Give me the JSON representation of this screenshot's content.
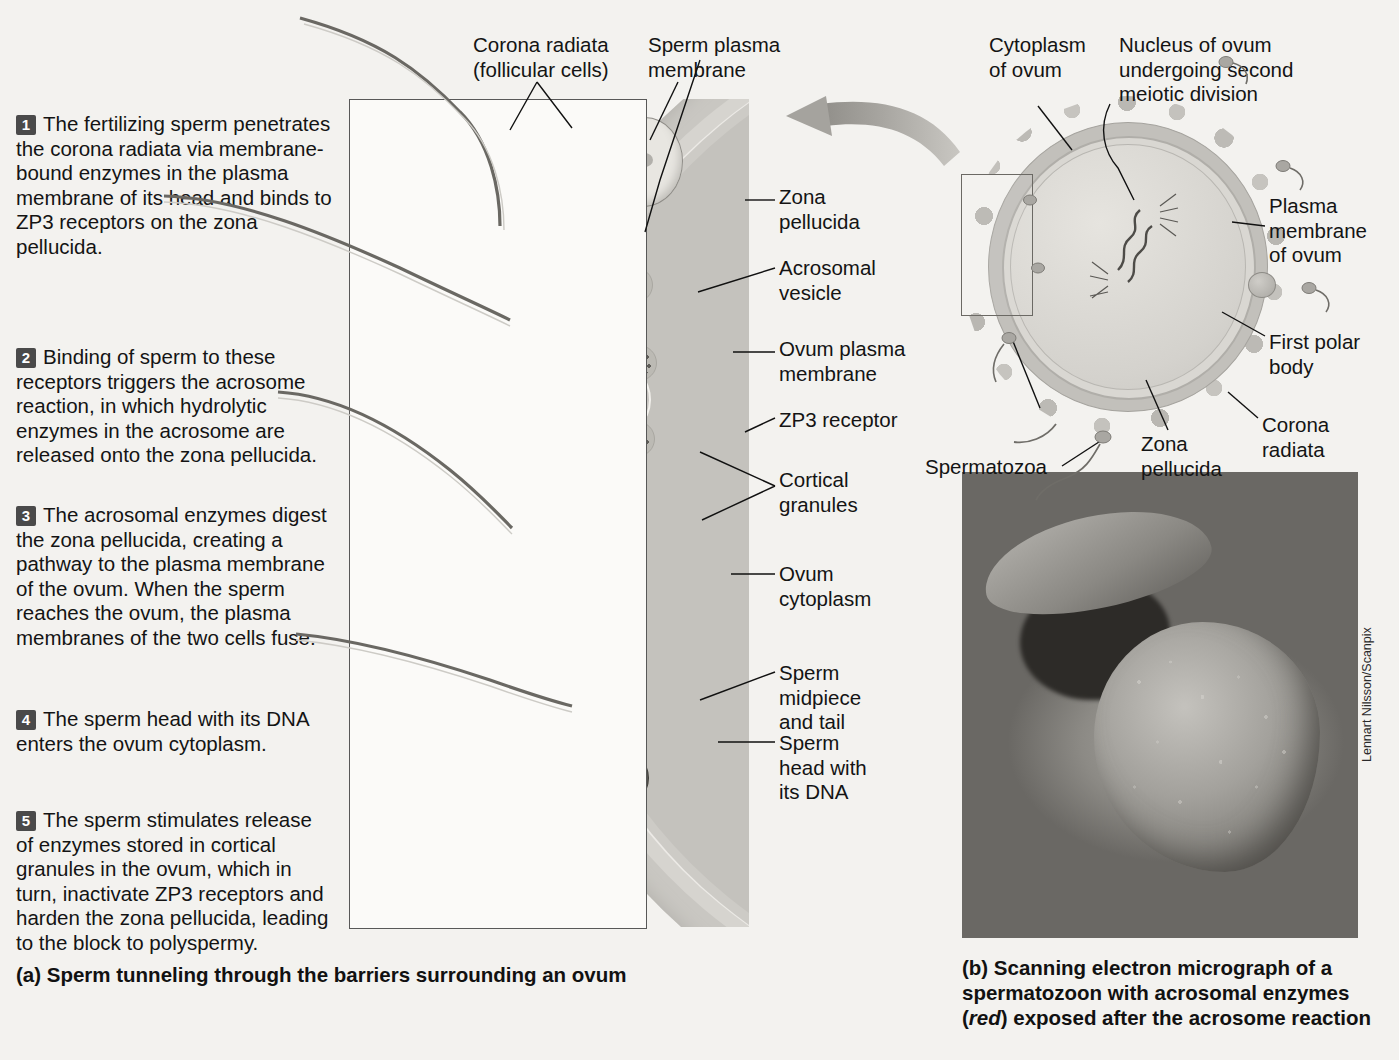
{
  "figure": {
    "panel_a_caption": "(a)  Sperm tunneling through the barriers surrounding an ovum",
    "panel_b_caption_line1": "(b)  Scanning electron micrograph of a",
    "panel_b_caption_line2": "spermatozoon with acrosomal enzymes",
    "panel_b_caption_line3_pre": "(",
    "panel_b_caption_italic": "red",
    "panel_b_caption_line3_post": ") exposed after the acrosome reaction",
    "credit": "Lennart Nilsson/Scanpix"
  },
  "steps": [
    {
      "num": "1",
      "text": "The fertilizing sperm penetrates the corona radiata via membrane-bound enzymes in the plasma membrane of its head and binds to ZP3 receptors on the zona pellucida."
    },
    {
      "num": "2",
      "text": "Binding of sperm to these receptors triggers the acrosome reaction, in which hydrolytic enzymes in the acrosome are released onto the zona pellucida."
    },
    {
      "num": "3",
      "text": "The acrosomal enzymes digest the zona pellucida, creating a pathway to the plasma membrane of the ovum. When the sperm reaches the ovum, the plasma membranes of the two cells fuse."
    },
    {
      "num": "4",
      "text": "The sperm head with its DNA enters the ovum cytoplasm."
    },
    {
      "num": "5",
      "text": "The sperm stimulates release of enzymes stored in cortical granules in the ovum, which in turn, inactivate ZP3 receptors and harden the zona pellucida, leading to the block to polyspermy."
    }
  ],
  "panel_a_labels": {
    "corona_radiata": "Corona radiata\n(follicular cells)",
    "sperm_plasma_membrane": "Sperm plasma\nmembrane",
    "zona_pellucida": "Zona\npellucida",
    "acrosomal_vesicle": "Acrosomal\nvesicle",
    "ovum_plasma_membrane": "Ovum plasma\nmembrane",
    "zp3_receptor": "ZP3 receptor",
    "cortical_granules": "Cortical\ngranules",
    "ovum_cytoplasm": "Ovum\ncytoplasm",
    "sperm_midpiece_tail": "Sperm\nmidpiece\nand tail",
    "sperm_head_dna": "Sperm\nhead with\nits DNA"
  },
  "panel_b_labels": {
    "cytoplasm_of_ovum": "Cytoplasm\nof ovum",
    "nucleus_of_ovum": "Nucleus of ovum\nundergoing second\nmeiotic division",
    "plasma_membrane_of_ovum": "Plasma\nmembrane\nof ovum",
    "first_polar_body": "First polar\nbody",
    "corona_radiata": "Corona\nradiata",
    "zona_pellucida": "Zona\npellucida",
    "spermatozoa": "Spermatozoa"
  },
  "colors": {
    "background": "#f3f2ef",
    "text": "#141414",
    "step_marker": "#4a4a4a",
    "leader_line": "#111111",
    "arrow": "#9a9893"
  }
}
